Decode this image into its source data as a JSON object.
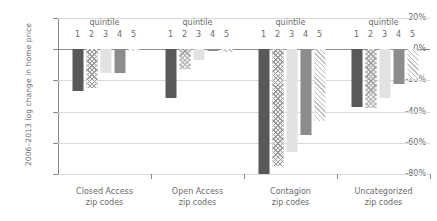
{
  "chart_data": {
    "type": "bar",
    "title": "",
    "xlabel": "",
    "ylabel": "2006–2013 log change in home price",
    "ylim": [
      -80,
      20
    ],
    "yticks": [
      20,
      0,
      -20,
      -40,
      -60,
      -80
    ],
    "ytick_labels": [
      "20%",
      "0%",
      "-20%",
      "-40%",
      "-60%",
      "-80%"
    ],
    "grid": true,
    "legend": "none",
    "series_label": "quintile",
    "quintiles": [
      "1",
      "2",
      "3",
      "4",
      "5"
    ],
    "categories": [
      "Closed Access zip codes",
      "Open Access zip codes",
      "Contagion zip codes",
      "Uncategorized zip codes"
    ],
    "groups": [
      {
        "name": "Closed Access zip codes",
        "line1": "Closed Access",
        "line2": "zip codes",
        "quintile_header": "quintile",
        "values": [
          -27,
          -25,
          -15,
          -15,
          -1
        ]
      },
      {
        "name": "Open Access zip codes",
        "line1": "Open Access",
        "line2": "zip codes",
        "quintile_header": "quintile",
        "values": [
          -31,
          -13,
          -7,
          -1,
          -2
        ]
      },
      {
        "name": "Contagion zip codes",
        "line1": "Contagion",
        "line2": "zip codes",
        "quintile_header": "quintile",
        "values": [
          -80,
          -75,
          -66,
          -55,
          -46
        ]
      },
      {
        "name": "Uncategorized zip codes",
        "line1": "Uncategorized",
        "line2": "zip codes",
        "quintile_header": "quintile",
        "values": [
          -37,
          -38,
          -31,
          -22,
          -19
        ]
      }
    ],
    "colors": {
      "quintile1": "#595959",
      "quintile2": "#9a9a9a",
      "quintile3": "#e2e2e2",
      "quintile4": "#8c8c8c",
      "quintile5": "#bdbdbd",
      "axis": "#8a8a8a",
      "gridline": "#d9d9d9",
      "text": "#6b6b6b"
    }
  }
}
